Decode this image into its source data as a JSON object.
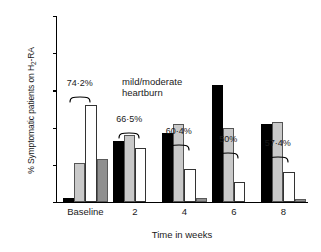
{
  "chart_data": {
    "type": "bar",
    "title": "",
    "xlabel": "Time in weeks",
    "ylabel": "% Symptomatic patients on H2-RA",
    "ylabel_prefix": "% Symptomatic patients on H",
    "ylabel_sub": "2",
    "ylabel_suffix": "-RA",
    "categories": [
      "Baseline",
      "2",
      "4",
      "6",
      "8"
    ],
    "ylim": [
      0,
      100
    ],
    "yticks": [
      0,
      20,
      40,
      60,
      80,
      100
    ],
    "ytick_labels": [
      "0",
      "20",
      "40",
      "60",
      "80",
      "100"
    ],
    "grid": false,
    "legend": "none",
    "series": [
      {
        "name": "black",
        "fill": "#000000",
        "values": [
          2,
          33,
          37,
          63,
          42
        ]
      },
      {
        "name": "light-gray",
        "fill": "#c9c9c9",
        "values": [
          21,
          36,
          42,
          40,
          43
        ]
      },
      {
        "name": "white",
        "fill": "#ffffff",
        "values": [
          52,
          29,
          18,
          11,
          16
        ]
      },
      {
        "name": "dark-gray",
        "fill": "#8f8f8f",
        "values": [
          23,
          0,
          2,
          0,
          1.5
        ]
      }
    ],
    "annotations": [
      {
        "label": "74·2%",
        "category": "Baseline"
      },
      {
        "label": "66·5%",
        "category": "2"
      },
      {
        "label": "60·4%",
        "category": "4"
      },
      {
        "label": "50%",
        "category": "6"
      },
      {
        "label": "57·4%",
        "category": "8"
      }
    ],
    "note_line1": "mild/moderate",
    "note_line2": "heartburn"
  }
}
